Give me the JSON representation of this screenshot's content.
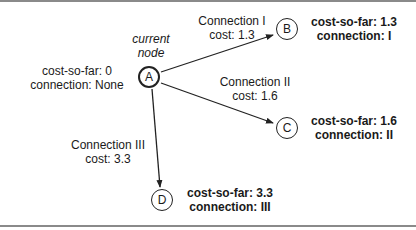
{
  "current_node_caption": [
    "current",
    "node"
  ],
  "nodes": [
    {
      "id": "A",
      "label": "A",
      "cost_so_far": "cost-so-far: 0",
      "connection": "connection: None",
      "current": true
    },
    {
      "id": "B",
      "label": "B",
      "cost_so_far": "cost-so-far: 1.3",
      "connection": "connection: I"
    },
    {
      "id": "C",
      "label": "C",
      "cost_so_far": "cost-so-far: 1.6",
      "connection": "connection: II"
    },
    {
      "id": "D",
      "label": "D",
      "cost_so_far": "cost-so-far: 3.3",
      "connection": "connection: III"
    }
  ],
  "edges": [
    {
      "from": "A",
      "to": "B",
      "name": "Connection I",
      "cost": "cost: 1.3"
    },
    {
      "from": "A",
      "to": "C",
      "name": "Connection II",
      "cost": "cost: 1.6"
    },
    {
      "from": "A",
      "to": "D",
      "name": "Connection III",
      "cost": "cost: 3.3"
    }
  ],
  "colors": {
    "stroke": "#222222",
    "frame": "#8a8a8a"
  }
}
